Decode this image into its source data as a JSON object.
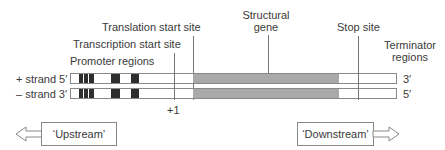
{
  "diagram": {
    "labels": {
      "translation_start": "Translation start site",
      "transcription_start": "Transcription start site",
      "promoter": "Promoter regions",
      "structural_gene_line1": "Structural",
      "structural_gene_line2": "gene",
      "stop_site": "Stop site",
      "terminator_line1": "Terminator",
      "terminator_line2": "regions",
      "plus_one": "+1"
    },
    "strands": {
      "plus": {
        "label": "+ strand 5′",
        "end": "3′"
      },
      "minus": {
        "label": "– strand 3′",
        "end": "5′"
      }
    },
    "directions": {
      "upstream": "‘Upstream’",
      "downstream": "‘Downstream’"
    },
    "colors": {
      "promoter_block": "#2e2e2e",
      "structural_gene": "#a9a9a9",
      "outline": "#888888"
    }
  }
}
